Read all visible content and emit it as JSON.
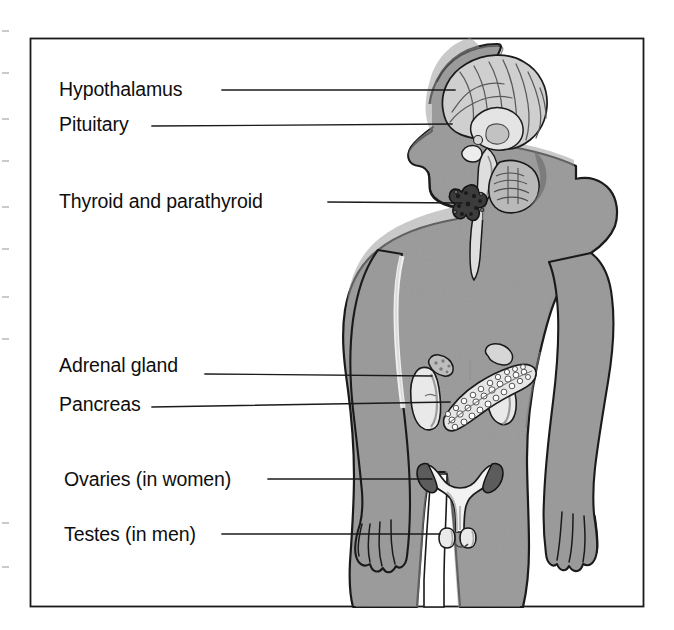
{
  "figure": {
    "kind": "anatomical-diagram",
    "view": "anterior human body silhouette, left-facing head in profile",
    "border_color": "#1a1a1a",
    "background_color": "#ffffff",
    "body_fill_color": "#9a9a9a",
    "body_outline_color": "#1a1a1a",
    "organ_light_color": "#e8e8e8",
    "organ_mid_color": "#bdbdbd",
    "organ_dark_color": "#3b3b3b",
    "leader_line_color": "#1a1a1a"
  },
  "labels": [
    {
      "id": "hypothalamus",
      "text": "Hypothalamus",
      "text_x": 59,
      "text_y": 96,
      "line_start_x": 222,
      "line_start_y": 90,
      "line_end_x": 455,
      "line_end_y": 90
    },
    {
      "id": "pituitary",
      "text": "Pituitary",
      "text_x": 59,
      "text_y": 131,
      "line_start_x": 152,
      "line_start_y": 126,
      "line_end_x": 452,
      "line_end_y": 124
    },
    {
      "id": "thyroid-and-parathyroid",
      "text": "Thyroid and parathyroid",
      "text_x": 59,
      "text_y": 208,
      "line_start_x": 328,
      "line_start_y": 202,
      "line_end_x": 462,
      "line_end_y": 203
    },
    {
      "id": "adrenal-gland",
      "text": "Adrenal gland",
      "text_x": 59,
      "text_y": 372,
      "line_start_x": 205,
      "line_start_y": 374,
      "line_end_x": 432,
      "line_end_y": 376
    },
    {
      "id": "pancreas",
      "text": "Pancreas",
      "text_x": 59,
      "text_y": 411,
      "line_start_x": 152,
      "line_start_y": 407,
      "line_end_x": 450,
      "line_end_y": 402
    },
    {
      "id": "ovaries",
      "text": "Ovaries (in women)",
      "text_x": 64,
      "text_y": 486,
      "line_start_x": 268,
      "line_start_y": 479,
      "line_end_x": 432,
      "line_end_y": 479
    },
    {
      "id": "testes",
      "text": "Testes (in men)",
      "text_x": 64,
      "text_y": 541,
      "line_start_x": 222,
      "line_start_y": 534,
      "line_end_x": 440,
      "line_end_y": 534
    }
  ],
  "organs": [
    {
      "id": "brain",
      "name": "brain-sagittal-section",
      "region": "head"
    },
    {
      "id": "brainstem",
      "name": "brainstem-and-spinal-cord",
      "region": "head-neck"
    },
    {
      "id": "cerebellum",
      "name": "cerebellum",
      "region": "head"
    },
    {
      "id": "thyroid",
      "name": "thyroid-gland",
      "region": "neck"
    },
    {
      "id": "kidney-left",
      "name": "kidney-left",
      "region": "abdomen"
    },
    {
      "id": "kidney-right",
      "name": "kidney-right",
      "region": "abdomen"
    },
    {
      "id": "adrenal-left",
      "name": "adrenal-gland-left",
      "region": "abdomen"
    },
    {
      "id": "adrenal-right",
      "name": "adrenal-gland-right",
      "region": "abdomen"
    },
    {
      "id": "pancreas",
      "name": "pancreas",
      "region": "abdomen"
    },
    {
      "id": "uterus",
      "name": "uterus-with-fallopian-tubes-and-ovaries",
      "region": "pelvis"
    },
    {
      "id": "testes",
      "name": "testes",
      "region": "pelvis"
    }
  ],
  "edge_ticks": [
    {
      "y": 30
    },
    {
      "y": 72
    },
    {
      "y": 118
    },
    {
      "y": 160
    },
    {
      "y": 206
    },
    {
      "y": 248
    },
    {
      "y": 296
    },
    {
      "y": 338
    },
    {
      "y": 522
    },
    {
      "y": 566
    }
  ]
}
